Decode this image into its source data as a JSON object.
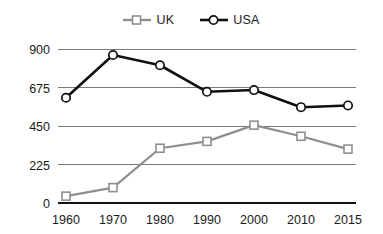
{
  "chart_data": {
    "type": "line",
    "title": "",
    "subtitle": "",
    "xlabel": "",
    "ylabel": "",
    "categories": [
      "1960",
      "1970",
      "1980",
      "1990",
      "2000",
      "2010",
      "2015"
    ],
    "x": [
      1960,
      1970,
      1980,
      1990,
      2000,
      2010,
      2015
    ],
    "series": [
      {
        "name": "UK",
        "color": "#8f8f8f",
        "marker": "square-open",
        "values": [
          40,
          90,
          320,
          360,
          455,
          390,
          315
        ]
      },
      {
        "name": "USA",
        "color": "#111111",
        "marker": "circle-open",
        "values": [
          615,
          865,
          805,
          650,
          660,
          560,
          570
        ]
      }
    ],
    "ylim": [
      0,
      900
    ],
    "yticks": [
      0,
      225,
      450,
      675,
      900
    ],
    "ytick_labels": [
      "0",
      "225",
      "450",
      "675",
      "900"
    ],
    "xlim": [
      1960,
      2015
    ],
    "grid": true,
    "grid_axis": "y",
    "legend_position": "top-center"
  },
  "legend": {
    "entries": [
      {
        "label": "UK",
        "color": "#8f8f8f",
        "marker": "square-open"
      },
      {
        "label": "USA",
        "color": "#111111",
        "marker": "circle-open"
      }
    ]
  },
  "axes": {
    "y_labels": [
      "900",
      "675",
      "450",
      "225",
      "0"
    ],
    "x_labels": [
      "1960",
      "1970",
      "1980",
      "1990",
      "2000",
      "2010",
      "2015"
    ]
  }
}
